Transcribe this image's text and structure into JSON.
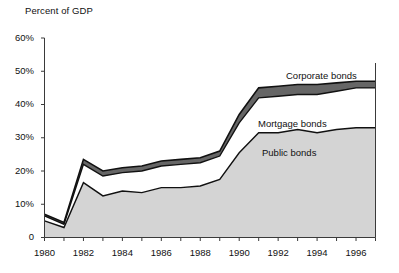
{
  "chart_data": {
    "type": "area",
    "stacked": true,
    "title": "",
    "ylabel": "Percent of GDP",
    "xlabel": "",
    "ylim": [
      0,
      60
    ],
    "xlim": [
      1980,
      1997
    ],
    "grid": false,
    "legend_position": "inline-annotations",
    "y_tick_labels": [
      "0",
      "10%",
      "20%",
      "30%",
      "40%",
      "50%",
      "60%"
    ],
    "y_tick_values": [
      0,
      10,
      20,
      30,
      40,
      50,
      60
    ],
    "x_tick_labels": [
      "1980",
      "1982",
      "1984",
      "1986",
      "1988",
      "1990",
      "1992",
      "1994",
      "1996"
    ],
    "x_tick_values": [
      1980,
      1982,
      1984,
      1986,
      1988,
      1990,
      1992,
      1994,
      1996
    ],
    "x": [
      1980,
      1981,
      1982,
      1983,
      1984,
      1985,
      1986,
      1987,
      1988,
      1989,
      1990,
      1991,
      1992,
      1993,
      1994,
      1995,
      1996,
      1997
    ],
    "series": [
      {
        "name": "Public bonds",
        "color": "#d4d4d4",
        "values": [
          5.0,
          3.0,
          16.5,
          12.5,
          14.0,
          13.5,
          15.0,
          15.0,
          15.5,
          17.5,
          25.5,
          31.5,
          31.5,
          32.5,
          31.5,
          32.5,
          33.0,
          33.0
        ]
      },
      {
        "name": "Mortgage bonds",
        "color": "#ffffff",
        "values": [
          1.5,
          1.0,
          5.5,
          6.0,
          5.5,
          6.5,
          6.5,
          7.0,
          7.0,
          7.0,
          9.0,
          10.5,
          11.0,
          10.5,
          11.5,
          11.5,
          12.0,
          12.0
        ]
      },
      {
        "name": "Corporate bonds",
        "color": "#666666",
        "values": [
          0.5,
          0.5,
          1.5,
          1.5,
          1.5,
          1.5,
          1.5,
          1.5,
          1.5,
          1.5,
          2.5,
          3.0,
          3.0,
          3.0,
          3.0,
          2.5,
          2.0,
          2.0
        ]
      }
    ],
    "cumulative_totals": [
      7.0,
      4.5,
      23.5,
      20.0,
      21.0,
      21.5,
      23.0,
      23.5,
      24.0,
      26.0,
      37.0,
      45.0,
      45.5,
      46.0,
      46.0,
      46.5,
      47.0,
      47.0
    ],
    "annotations": [
      {
        "text": "Corporate bonds",
        "x_px": 286,
        "y_px": 70
      },
      {
        "text": "Mortgage bonds",
        "x_px": 258,
        "y_px": 118
      },
      {
        "text": "Public bonds",
        "x_px": 262,
        "y_px": 147
      }
    ]
  },
  "axis": {
    "y_title": "Percent of GDP"
  }
}
